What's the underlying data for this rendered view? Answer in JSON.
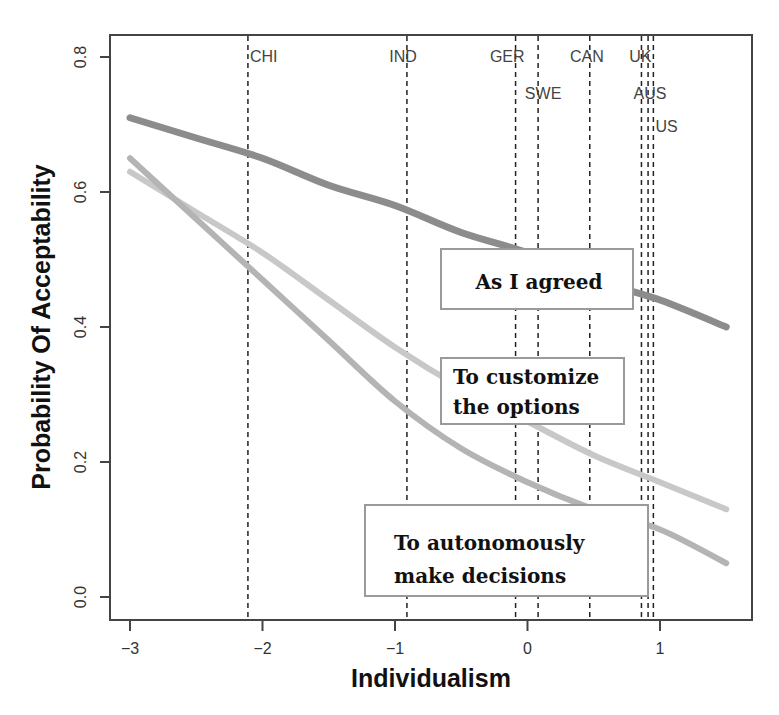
{
  "chart_data": {
    "type": "line",
    "title": "",
    "xlabel": "Individualism",
    "ylabel": "Probability Of Acceptability",
    "xlim": [
      -3.15,
      1.7
    ],
    "ylim": [
      -0.03,
      0.83
    ],
    "x_ticks": [
      -3,
      -2,
      -1,
      0,
      1
    ],
    "x_tick_labels": [
      "−3",
      "−2",
      "−1",
      "0",
      "1"
    ],
    "y_ticks": [
      0.0,
      0.2,
      0.4,
      0.6,
      0.8
    ],
    "y_tick_labels": [
      "0.0",
      "0.2",
      "0.4",
      "0.6",
      "0.8"
    ],
    "grid": false,
    "legend_position": "inline boxes on right",
    "x": [
      -3.0,
      -2.5,
      -2.0,
      -1.5,
      -1.0,
      -0.5,
      0.0,
      0.5,
      1.0,
      1.5
    ],
    "series": [
      {
        "name": "As I agreed",
        "color": "#8c8c8c",
        "values": [
          0.71,
          0.68,
          0.65,
          0.61,
          0.58,
          0.54,
          0.51,
          0.47,
          0.44,
          0.4
        ]
      },
      {
        "name": "To customize the options",
        "color": "#c8c8c8",
        "values": [
          0.63,
          0.57,
          0.51,
          0.44,
          0.37,
          0.31,
          0.26,
          0.21,
          0.17,
          0.13
        ]
      },
      {
        "name": "To autonomously make decisions",
        "color": "#b4b4b4",
        "values": [
          0.65,
          0.56,
          0.47,
          0.38,
          0.29,
          0.22,
          0.17,
          0.13,
          0.1,
          0.05
        ]
      }
    ],
    "reference_lines": [
      {
        "label": "CHI",
        "x": -2.11,
        "label_row": 0
      },
      {
        "label": "IND",
        "x": -0.91,
        "label_row": 0
      },
      {
        "label": "GER",
        "x": -0.09,
        "label_row": 0
      },
      {
        "label": "SWE",
        "x": 0.08,
        "label_row": 1
      },
      {
        "label": "CAN",
        "x": 0.47,
        "label_row": 0
      },
      {
        "label": "UK",
        "x": 0.86,
        "label_row": 0
      },
      {
        "label": "AUS",
        "x": 0.91,
        "label_row": 1
      },
      {
        "label": "US",
        "x": 0.95,
        "label_row": 2
      }
    ],
    "annotations": [
      {
        "text": [
          "As I agreed"
        ],
        "series": "As I agreed"
      },
      {
        "text": [
          "To customize",
          "the options"
        ],
        "series": "To customize the options"
      },
      {
        "text": [
          "To autonomously",
          "make decisions"
        ],
        "series": "To autonomously make decisions"
      }
    ]
  }
}
